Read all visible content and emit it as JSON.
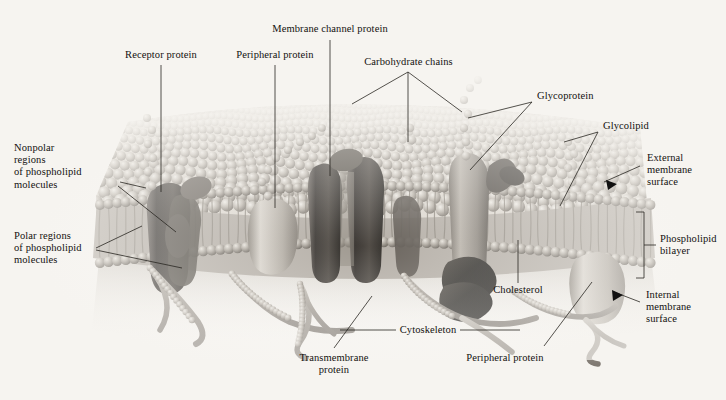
{
  "figure": {
    "type": "biological-diagram",
    "background_color": "#f6f4f0",
    "ink_color": "#13110f",
    "palette": {
      "lipid_head_light": "#cfcac2",
      "lipid_head_mid": "#9d978e",
      "lipid_head_dark": "#6d675f",
      "protein_dark": "#4a4641",
      "protein_mid": "#7d776f",
      "protein_light": "#b9b3aa",
      "cytoskeleton": "#a8a39b",
      "carbohydrate": "#b6b0a7",
      "arrow_black": "#111111"
    }
  },
  "labels": {
    "receptor_protein": "Receptor protein",
    "peripheral_protein_top": "Peripheral protein",
    "membrane_channel_protein": "Membrane channel protein",
    "carbohydrate_chains": "Carbohydrate chains",
    "glycoprotein": "Glycoprotein",
    "glycolipid": "Glycolipid",
    "external_membrane_surface": "External\nmembrane\nsurface",
    "phospholipid_bilayer": "Phospholipid\nbilayer",
    "internal_membrane_surface": "Internal\nmembrane\nsurface",
    "nonpolar_regions": "Nonpolar\nregions\nof phospholipid\nmolecules",
    "polar_regions": "Polar regions\nof phospholipid\nmolecules",
    "transmembrane_protein": "Transmembrane\nprotein",
    "cytoskeleton": "Cytoskeleton",
    "cholesterol": "Cholesterol",
    "peripheral_protein_bottom": "Peripheral protein"
  },
  "structures": [
    {
      "name": "phospholipid-bilayer",
      "description": "two leaflets of spherical polar heads with nonpolar fatty-acid tails between"
    },
    {
      "name": "receptor-protein",
      "description": "dark integral protein on left spanning the bilayer"
    },
    {
      "name": "peripheral-protein-upper",
      "description": "light rounded protein resting in the outer leaflet"
    },
    {
      "name": "membrane-channel-protein",
      "description": "two dark columns forming an aqueous pore"
    },
    {
      "name": "glycoprotein",
      "description": "transmembrane protein with carbohydrate chain attached"
    },
    {
      "name": "glycolipid",
      "description": "lipid with carbohydrate chain attached at outer surface"
    },
    {
      "name": "cholesterol",
      "description": "dark lobed molecules wedged in the inner leaflet"
    },
    {
      "name": "cytoskeleton",
      "description": "filament network beneath the inner surface"
    },
    {
      "name": "transmembrane-protein",
      "description": "protein crossing the full bilayer"
    },
    {
      "name": "peripheral-protein-lower",
      "description": "light protein attached to the inner surface"
    }
  ]
}
